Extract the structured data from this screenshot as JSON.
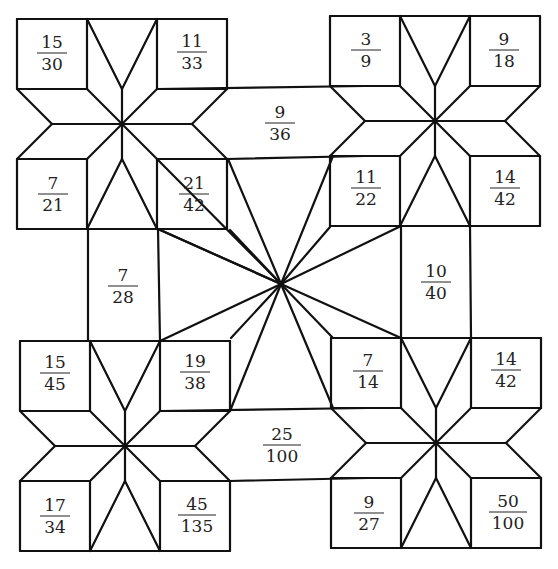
{
  "stroke_color": "#111111",
  "fractions": {
    "top_left_star": {
      "top_left": {
        "num": "15",
        "den": "30"
      },
      "top_right": {
        "num": "11",
        "den": "33"
      },
      "bottom_left": {
        "num": "7",
        "den": "21"
      },
      "bottom_right": {
        "num": "21",
        "den": "42"
      }
    },
    "top_right_star": {
      "top_left": {
        "num": "3",
        "den": "9"
      },
      "top_right": {
        "num": "9",
        "den": "18"
      },
      "bottom_left": {
        "num": "11",
        "den": "22"
      },
      "bottom_right": {
        "num": "14",
        "den": "42"
      }
    },
    "bottom_left_star": {
      "top_left": {
        "num": "15",
        "den": "45"
      },
      "top_right": {
        "num": "19",
        "den": "38"
      },
      "bottom_left": {
        "num": "17",
        "den": "34"
      },
      "bottom_right": {
        "num": "45",
        "den": "135"
      }
    },
    "bottom_right_star": {
      "top_left": {
        "num": "7",
        "den": "14"
      },
      "top_right": {
        "num": "14",
        "den": "42"
      },
      "bottom_left": {
        "num": "9",
        "den": "27"
      },
      "bottom_right": {
        "num": "50",
        "den": "100"
      }
    },
    "top_hexagon": {
      "num": "9",
      "den": "36"
    },
    "bottom_hexagon": {
      "num": "25",
      "den": "100"
    },
    "left_rectangle": {
      "num": "7",
      "den": "28"
    },
    "right_rectangle": {
      "num": "10",
      "den": "40"
    }
  }
}
